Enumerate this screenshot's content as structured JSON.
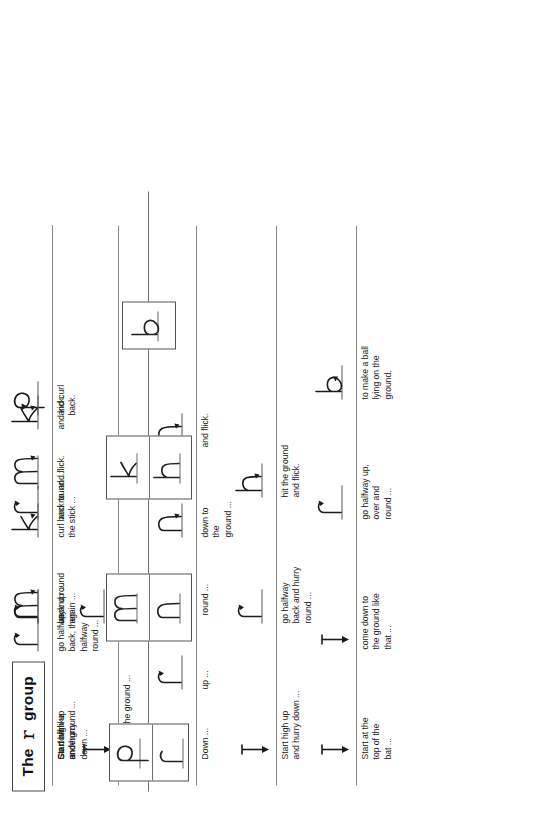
{
  "title": {
    "prefix": "The",
    "cursive_letter": "r",
    "suffix": "group"
  },
  "colors": {
    "ink": "#1b1b1b",
    "rule": "#8d8d8d",
    "box_border": "#545454",
    "background": "#ffffff"
  },
  "letter_groups": [
    {
      "name": "r-p-group",
      "letters": [
        "p",
        "r"
      ]
    },
    {
      "name": "n-m-group",
      "letters": [
        "m",
        "n"
      ]
    },
    {
      "name": "h-k-group",
      "letters": [
        "k",
        "h"
      ]
    },
    {
      "name": "b-group",
      "letters": [
        "b"
      ]
    }
  ],
  "rows": [
    {
      "id": "row-r",
      "letter": "r",
      "steps": [
        {
          "caption": "Down to the ground ...",
          "glyph": "↓",
          "kind": "arrow-down"
        },
        {
          "caption": "back up and\nround ... rrr.",
          "glyph": "r",
          "kind": "letter"
        }
      ]
    },
    {
      "id": "row-p",
      "letter": "p",
      "steps": [
        {
          "caption": "Go down\nunderground ...",
          "glyph": "↓",
          "kind": "arrow-down"
        },
        {
          "caption": "back up ...",
          "glyph": "r",
          "kind": "letter"
        },
        {
          "caption": "and round ...",
          "glyph": "r",
          "kind": "letter"
        },
        {
          "caption": "and curl\nback.",
          "glyph": "p",
          "kind": "letter"
        }
      ]
    },
    {
      "id": "row-n",
      "letter": "n",
      "steps": [
        {
          "caption": "Down ...",
          "glyph": "↓",
          "kind": "arrow-down"
        },
        {
          "caption": "up ...",
          "glyph": "r",
          "kind": "letter"
        },
        {
          "caption": "round ...",
          "glyph": "r",
          "kind": "letter"
        },
        {
          "caption": "down to\nthe\nground ...",
          "glyph": "n",
          "kind": "letter"
        },
        {
          "caption": "and flick.",
          "glyph": "n",
          "kind": "letter"
        }
      ]
    },
    {
      "id": "row-m",
      "letter": "m",
      "steps": [
        {
          "caption": "Start off like\nan n ...",
          "glyph": "n",
          "kind": "letter"
        },
        {
          "caption": "up and round\nagain ...",
          "glyph": "m",
          "kind": "letter"
        },
        {
          "caption": "and flick.",
          "glyph": "m",
          "kind": "letter"
        }
      ]
    },
    {
      "id": "row-h",
      "letter": "h",
      "steps": [
        {
          "caption": "Start high up\nand hurry down ...",
          "glyph": "↓",
          "kind": "arrow-down"
        },
        {
          "caption": "go halfway\nback and hurry\nround ...",
          "glyph": "r",
          "kind": "letter"
        },
        {
          "caption": "hit the ground\nand flick.",
          "glyph": "h",
          "kind": "letter"
        }
      ]
    },
    {
      "id": "row-k",
      "letter": "k",
      "steps": [
        {
          "caption": "Start high up\nand hurry\ndown ...",
          "glyph": "↓",
          "kind": "arrow-down"
        },
        {
          "caption": "go halfway\nback, then\nhalfway\nround ...",
          "glyph": "r",
          "kind": "letter"
        },
        {
          "caption": "curl back to\nthe stick ...",
          "glyph": "k",
          "kind": "letter"
        },
        {
          "caption": "and kick.",
          "glyph": "k",
          "kind": "letter"
        }
      ]
    },
    {
      "id": "row-b",
      "letter": "b",
      "steps": [
        {
          "caption": "Start at the\ntop of the\nbat ...",
          "glyph": "↓",
          "kind": "arrow-down"
        },
        {
          "caption": "come down to\nthe ground like\nthat ...",
          "glyph": "↓",
          "kind": "arrow-down"
        },
        {
          "caption": "go halfway up,\nover and\nround ...",
          "glyph": "r",
          "kind": "letter"
        },
        {
          "caption": "to make a ball\nlying on the\nground.",
          "glyph": "b",
          "kind": "letter"
        }
      ]
    }
  ]
}
